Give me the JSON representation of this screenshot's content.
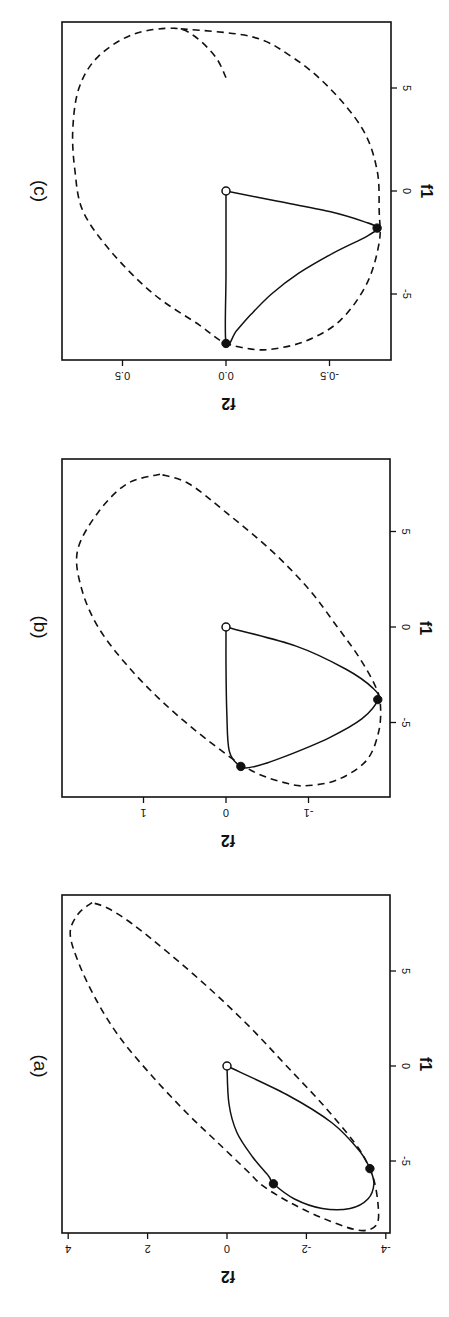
{
  "figure": {
    "orientation": "rotated-90-clockwise",
    "background": "#ffffff",
    "ink": "#111111"
  },
  "chart_data": [
    {
      "type": "line",
      "panel_label": "(a)",
      "xlabel": "f1",
      "ylabel": "f2",
      "xlim": [
        -8.9,
        8.6
      ],
      "ylim": [
        -4.0,
        4.1
      ],
      "xticks": [
        -5,
        0,
        5
      ],
      "xtick_labels": [
        "-5",
        "0",
        "5"
      ],
      "yticks": [
        -4,
        -2,
        0,
        2,
        4
      ],
      "ytick_labels": [
        "-4",
        "-2",
        "0",
        "2",
        "4"
      ],
      "grid": false,
      "screen": {
        "x0": 227,
        "sx": 39.7,
        "y0": 1066,
        "sy": 19.0,
        "frame": {
          "left": 62,
          "top": 895,
          "right": 390,
          "bottom": 1233
        }
      },
      "series": [
        {
          "name": "ellipse",
          "style": "dashed",
          "points": [
            [
              8.6,
              3.4
            ],
            [
              8.0,
              3.75
            ],
            [
              7.0,
              3.95
            ],
            [
              5.5,
              3.75
            ],
            [
              3.5,
              3.3
            ],
            [
              1.5,
              2.7
            ],
            [
              -0.5,
              1.9
            ],
            [
              -2.5,
              1.0
            ],
            [
              -4.0,
              0.25
            ],
            [
              -5.5,
              -0.5
            ],
            [
              -6.3,
              -0.9
            ],
            [
              -7.2,
              -1.6
            ],
            [
              -8.0,
              -2.4
            ],
            [
              -8.6,
              -3.2
            ],
            [
              -8.6,
              -3.6
            ],
            [
              -8.2,
              -3.8
            ],
            [
              -7.2,
              -3.8
            ],
            [
              -6.0,
              -3.7
            ],
            [
              -5.0,
              -3.5
            ],
            [
              -4.0,
              -3.2
            ],
            [
              -2.0,
              -2.4
            ],
            [
              0.0,
              -1.5
            ],
            [
              2.0,
              -0.6
            ],
            [
              4.0,
              0.4
            ],
            [
              6.0,
              1.5
            ],
            [
              7.5,
              2.4
            ],
            [
              8.3,
              3.0
            ],
            [
              8.6,
              3.4
            ]
          ]
        },
        {
          "name": "path",
          "style": "solid",
          "points": [
            [
              0.0,
              0.0
            ],
            [
              -2.0,
              -0.05
            ],
            [
              -3.5,
              -0.25
            ],
            [
              -4.8,
              -0.65
            ],
            [
              -5.8,
              -1.05
            ],
            [
              -6.2,
              -1.17
            ],
            [
              -7.0,
              -1.7
            ],
            [
              -7.5,
              -2.4
            ],
            [
              -7.5,
              -3.1
            ],
            [
              -7.0,
              -3.55
            ],
            [
              -6.2,
              -3.7
            ],
            [
              -5.4,
              -3.6
            ],
            [
              -4.5,
              -3.35
            ],
            [
              -3.0,
              -2.65
            ],
            [
              -1.5,
              -1.5
            ],
            [
              0.0,
              0.0
            ]
          ]
        },
        {
          "name": "origin",
          "style": "open-point",
          "points": [
            [
              0.0,
              0.0
            ]
          ]
        },
        {
          "name": "markers",
          "style": "filled-point",
          "points": [
            [
              -5.4,
              -3.6
            ],
            [
              -6.2,
              -1.17
            ]
          ]
        }
      ]
    },
    {
      "type": "line",
      "panel_label": "(b)",
      "xlabel": "f1",
      "ylabel": "f2",
      "xlim": [
        -8.8,
        8.8
      ],
      "ylim": [
        -1.98,
        2.0
      ],
      "xticks": [
        -5,
        0,
        5
      ],
      "xtick_labels": [
        "-5",
        "0",
        "5"
      ],
      "yticks": [
        -1,
        0,
        1
      ],
      "ytick_labels": [
        "-1",
        "0",
        "1"
      ],
      "grid": false,
      "screen": {
        "x0": 226,
        "sx": 82.5,
        "y0": 627,
        "sy": 19.1,
        "frame": {
          "left": 62,
          "top": 459,
          "right": 390,
          "bottom": 797
        }
      },
      "series": [
        {
          "name": "ellipse",
          "style": "dashed",
          "points": [
            [
              8.0,
              0.8
            ],
            [
              7.5,
              1.2
            ],
            [
              6.0,
              1.55
            ],
            [
              4.0,
              1.8
            ],
            [
              2.0,
              1.75
            ],
            [
              0.0,
              1.55
            ],
            [
              -2.0,
              1.2
            ],
            [
              -4.0,
              0.75
            ],
            [
              -6.0,
              0.2
            ],
            [
              -7.5,
              -0.3
            ],
            [
              -8.2,
              -0.75
            ],
            [
              -8.3,
              -1.0
            ],
            [
              -8.0,
              -1.35
            ],
            [
              -7.0,
              -1.7
            ],
            [
              -5.5,
              -1.85
            ],
            [
              -4.0,
              -1.87
            ],
            [
              -3.0,
              -1.8
            ],
            [
              -1.5,
              -1.6
            ],
            [
              0.0,
              -1.35
            ],
            [
              2.0,
              -1.0
            ],
            [
              4.0,
              -0.55
            ],
            [
              6.0,
              0.0
            ],
            [
              7.5,
              0.45
            ],
            [
              8.0,
              0.8
            ]
          ]
        },
        {
          "name": "path",
          "style": "solid",
          "points": [
            [
              0.0,
              0.0
            ],
            [
              -2.0,
              0.0
            ],
            [
              -4.5,
              -0.01
            ],
            [
              -6.5,
              -0.04
            ],
            [
              -7.3,
              -0.18
            ],
            [
              -7.3,
              -0.35
            ],
            [
              -6.8,
              -0.7
            ],
            [
              -5.8,
              -1.25
            ],
            [
              -4.8,
              -1.65
            ],
            [
              -3.8,
              -1.84
            ],
            [
              -3.2,
              -1.78
            ],
            [
              -2.2,
              -1.45
            ],
            [
              -1.0,
              -0.85
            ],
            [
              0.0,
              0.0
            ]
          ]
        },
        {
          "name": "origin",
          "style": "open-point",
          "points": [
            [
              0.0,
              0.0
            ]
          ]
        },
        {
          "name": "markers",
          "style": "filled-point",
          "points": [
            [
              -3.8,
              -1.84
            ],
            [
              -7.3,
              -0.18
            ]
          ]
        }
      ]
    },
    {
      "type": "line",
      "panel_label": "(c)",
      "xlabel": "f1",
      "ylabel": "f2",
      "xlim": [
        -8.2,
        8.2
      ],
      "ylim": [
        -0.79,
        0.79
      ],
      "xticks": [
        -5,
        0,
        5
      ],
      "xtick_labels": [
        "-5",
        "0",
        "5"
      ],
      "yticks": [
        -0.5,
        0.0,
        0.5
      ],
      "ytick_labels": [
        "-0.5",
        "0.0",
        "0.5"
      ],
      "grid": false,
      "screen": {
        "x0": 226,
        "sx": 207,
        "y0": 191,
        "sy": 20.6,
        "frame": {
          "left": 62,
          "top": 22,
          "right": 391,
          "bottom": 360
        }
      },
      "series": [
        {
          "name": "ellipse",
          "style": "dashed",
          "points": [
            [
              5.5,
              0.0
            ],
            [
              6.5,
              0.05
            ],
            [
              7.5,
              0.15
            ],
            [
              7.9,
              0.25
            ],
            [
              7.6,
              0.45
            ],
            [
              6.5,
              0.62
            ],
            [
              5.0,
              0.71
            ],
            [
              3.0,
              0.74
            ],
            [
              1.0,
              0.73
            ],
            [
              -1.0,
              0.69
            ],
            [
              -3.0,
              0.55
            ],
            [
              -5.0,
              0.35
            ],
            [
              -6.5,
              0.13
            ],
            [
              -7.3,
              0.02
            ],
            [
              -7.6,
              -0.08
            ],
            [
              -7.7,
              -0.2
            ],
            [
              -7.3,
              -0.38
            ],
            [
              -6.3,
              -0.55
            ],
            [
              -4.5,
              -0.68
            ],
            [
              -2.5,
              -0.74
            ],
            [
              -1.0,
              -0.74
            ],
            [
              1.0,
              -0.73
            ],
            [
              3.0,
              -0.66
            ],
            [
              5.0,
              -0.5
            ],
            [
              6.5,
              -0.32
            ],
            [
              7.5,
              -0.12
            ],
            [
              7.9,
              0.25
            ]
          ]
        },
        {
          "name": "path",
          "style": "solid",
          "points": [
            [
              0.0,
              0.0
            ],
            [
              -0.5,
              -0.25
            ],
            [
              -1.0,
              -0.5
            ],
            [
              -1.5,
              -0.67
            ],
            [
              -1.8,
              -0.73
            ],
            [
              -2.2,
              -0.68
            ],
            [
              -3.0,
              -0.52
            ],
            [
              -4.0,
              -0.35
            ],
            [
              -5.0,
              -0.22
            ],
            [
              -6.0,
              -0.12
            ],
            [
              -6.8,
              -0.05
            ],
            [
              -7.4,
              0.0
            ],
            [
              -4.0,
              0.0
            ],
            [
              0.0,
              0.0
            ]
          ]
        },
        {
          "name": "origin",
          "style": "open-point",
          "points": [
            [
              0.0,
              0.0
            ]
          ]
        },
        {
          "name": "markers",
          "style": "filled-point",
          "points": [
            [
              -1.8,
              -0.73
            ],
            [
              -7.4,
              0.0
            ]
          ]
        }
      ]
    }
  ],
  "panels": [
    {
      "label": "(a)",
      "xlabel": "f1",
      "ylabel": "f2"
    },
    {
      "label": "(b)",
      "xlabel": "f1",
      "ylabel": "f2"
    },
    {
      "label": "(c)",
      "xlabel": "f1",
      "ylabel": "f2"
    }
  ]
}
